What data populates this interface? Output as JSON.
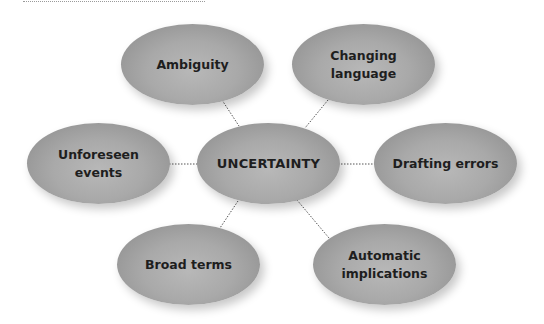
{
  "diagram": {
    "type": "mind-map",
    "center": {
      "id": "uncertainty",
      "label": "UNCERTAINTY",
      "cx": 268,
      "cy": 164
    },
    "nodes": [
      {
        "id": "ambiguity",
        "label": "Ambiguity",
        "cx": 192,
        "cy": 64
      },
      {
        "id": "changing-language",
        "label": "Changing\nlanguage",
        "cx": 363,
        "cy": 64
      },
      {
        "id": "unforeseen-events",
        "label": "Unforeseen events",
        "cx": 98,
        "cy": 164
      },
      {
        "id": "drafting-errors",
        "label": "Drafting errors",
        "cx": 445,
        "cy": 163
      },
      {
        "id": "broad-terms",
        "label": "Broad terms",
        "cx": 189,
        "cy": 265
      },
      {
        "id": "automatic-implications",
        "label": "Automatic\nimplications",
        "cx": 385,
        "cy": 264
      }
    ],
    "connectors": [
      {
        "from": "ambiguity",
        "to": "uncertainty",
        "x1": 222,
        "y1": 100,
        "x2": 239,
        "y2": 126
      },
      {
        "from": "changing-language",
        "to": "uncertainty",
        "x1": 328,
        "y1": 100,
        "x2": 305,
        "y2": 128
      },
      {
        "from": "unforeseen-events",
        "to": "uncertainty",
        "x1": 169,
        "y1": 164,
        "x2": 197,
        "y2": 164
      },
      {
        "from": "drafting-errors",
        "to": "uncertainty",
        "x1": 339,
        "y1": 164,
        "x2": 374,
        "y2": 164
      },
      {
        "from": "broad-terms",
        "to": "uncertainty",
        "x1": 238,
        "y1": 201,
        "x2": 220,
        "y2": 228
      },
      {
        "from": "automatic-implications",
        "to": "uncertainty",
        "x1": 297,
        "y1": 200,
        "x2": 329,
        "y2": 238
      }
    ],
    "colors": {
      "node_fill": "#a9a9a9",
      "node_edge": "#8a8a8a",
      "text": "#1e1e1e",
      "connector": "#555555",
      "background": "#ffffff"
    }
  }
}
